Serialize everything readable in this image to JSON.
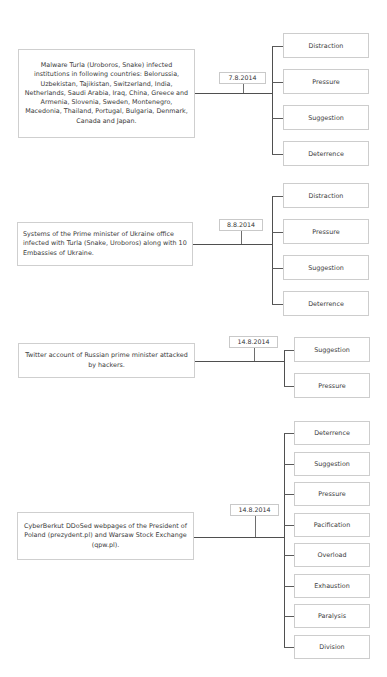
{
  "diagram": {
    "background_color": "#ffffff",
    "box_border_color": "#cdcdcd",
    "connector_color": "#4f4f4f",
    "text_color": "#3a3a3a",
    "events": [
      {
        "id": "event-1",
        "description": "Malware Turla (Uroboros, Snake) infected institutions in following countries: Belorussia, Uzbekistan, Tajikistan, Switzerland, India, Netherlands, Saudi Arabia, Iraq, China, Greece and Armenia, Slovenia, Sweden, Montenegro, Macedonia, Thailand, Portugal, Bulgaria, Denmark, Canada and Japan.",
        "date": "7.8.2014",
        "text_align": "center",
        "effects": [
          "Distraction",
          "Pressure",
          "Suggestion",
          "Deterrence"
        ]
      },
      {
        "id": "event-2",
        "description": "Systems of the Prime minister of Ukraine office infected with Turla (Snake, Uroboros) along with 10 Embassies of Ukraine.",
        "date": "8.8.2014",
        "text_align": "left",
        "effects": [
          "Distraction",
          "Pressure",
          "Suggestion",
          "Deterrence"
        ]
      },
      {
        "id": "event-3",
        "description": "Twitter account of Russian prime minister attacked by hackers.",
        "date": "14.8.2014",
        "text_align": "center",
        "effects": [
          "Suggestion",
          "Pressure"
        ]
      },
      {
        "id": "event-4",
        "description": "CyberBerkut DDoSed webpages of the President of Poland (prezydent.pl) and Warsaw Stock Exchange (qpw.pl).",
        "date": "14.8.2014",
        "text_align": "center",
        "effects": [
          "Deterrence",
          "Suggestion",
          "Pressure",
          "Pacification",
          "Overload",
          "Exhaustion",
          "Paralysis",
          "Division"
        ]
      }
    ]
  }
}
